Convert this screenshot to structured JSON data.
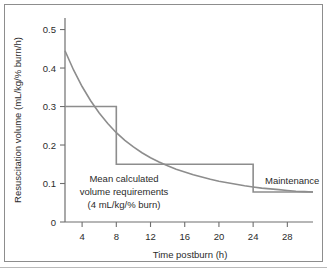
{
  "figure": {
    "name": "resuscitation-volume-vs-time-postburn",
    "background_color": "#ffffff",
    "frame_color": "#8d8d8d"
  },
  "chart_data": {
    "type": "line",
    "title": "",
    "subtitle": "",
    "xlabel": "Time postburn (h)",
    "ylabel": "Resuscitation volume (mL/kg/% burn/h)",
    "xlim": [
      2,
      31
    ],
    "ylim": [
      0,
      0.53
    ],
    "grid": false,
    "legend_position": "none",
    "xticks": [
      4,
      8,
      12,
      16,
      20,
      24,
      28
    ],
    "xtick_labels": [
      "4",
      "8",
      "12",
      "16",
      "20",
      "24",
      "28"
    ],
    "yticks": [
      0,
      0.1,
      0.2,
      0.3,
      0.4,
      0.5
    ],
    "ytick_labels": [
      "0",
      "0.1",
      "0.2",
      "0.3",
      "0.4",
      "0.5"
    ],
    "series": [
      {
        "name": "Mean calculated volume requirements (4 mL/kg/% burn)",
        "style": "smooth-decay-curve",
        "color": "#8d8d8d",
        "x": [
          2,
          3,
          4,
          5,
          6,
          7,
          8,
          9,
          10,
          11,
          12,
          13,
          14,
          15,
          16,
          17,
          18,
          19,
          20,
          21,
          22,
          23,
          24,
          25,
          26,
          27,
          28,
          29,
          30,
          31
        ],
        "y": [
          0.445,
          0.395,
          0.352,
          0.315,
          0.283,
          0.256,
          0.232,
          0.212,
          0.195,
          0.18,
          0.167,
          0.156,
          0.146,
          0.137,
          0.13,
          0.123,
          0.117,
          0.111,
          0.106,
          0.102,
          0.098,
          0.094,
          0.091,
          0.088,
          0.086,
          0.084,
          0.082,
          0.08,
          0.079,
          0.078
        ]
      },
      {
        "name": "Prescribed resuscitation step schedule",
        "style": "step",
        "color": "#8d8d8d",
        "x": [
          2,
          8,
          8,
          24,
          24,
          31
        ],
        "y": [
          0.3,
          0.3,
          0.15,
          0.15,
          0.078,
          0.078
        ]
      }
    ],
    "annotations": [
      {
        "id": "mean-calculated-volume",
        "lines": [
          "Mean calculated",
          "volume requirements",
          "(4 mL/kg/% burn)"
        ],
        "x": 8.3,
        "y": 0.105
      },
      {
        "id": "maintenance",
        "lines": [
          "Maintenance"
        ],
        "x": 24.8,
        "y": 0.105
      }
    ]
  },
  "axes": {
    "y_axis_label": "Resuscitation volume (mL/kg/% burn/h)",
    "x_axis_label": "Time postburn (h)",
    "y_ticks": [
      "0.5",
      "0.4",
      "0.3",
      "0.2",
      "0.1",
      "0"
    ],
    "x_ticks": [
      "4",
      "8",
      "12",
      "16",
      "20",
      "24",
      "28"
    ]
  },
  "annotations": {
    "mean_line_1": "Mean calculated",
    "mean_line_2": "volume requirements",
    "mean_line_3": "(4 mL/kg/% burn)",
    "maintenance": "Maintenance"
  },
  "colors": {
    "line": "#8d8d8d",
    "axis": "#6f6f6f",
    "text": "#2b2b2b",
    "frame": "#8d8d8d",
    "background": "#ffffff"
  }
}
